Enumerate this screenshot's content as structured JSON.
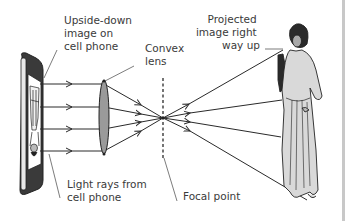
{
  "diagram": {
    "labels": {
      "phone_image": [
        "Upside-down",
        "image on",
        "cell phone"
      ],
      "lens": [
        "Convex",
        "lens"
      ],
      "projected": [
        "Projected",
        "image right",
        "way up"
      ],
      "light_rays": [
        "Light rays from",
        "cell phone"
      ],
      "focal_point": "Focal point"
    },
    "components": [
      "cell-phone",
      "light-rays",
      "convex-lens",
      "focal-point",
      "projected-figure"
    ],
    "colors": {
      "line": "#2a2a2a",
      "lens_fill": "#9a9a9a",
      "figure_fill": "#d9d9d9",
      "phone_bezel": "#3a3a3a",
      "text": "#3a3a3a"
    }
  }
}
